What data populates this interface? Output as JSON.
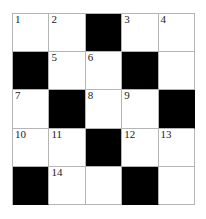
{
  "puzzle": {
    "type": "crossword-grid",
    "rows": 5,
    "cols": 5,
    "colors": {
      "block": "#000000",
      "open": "#ffffff",
      "grid_line": "#b5b5b5",
      "number_text": "#1a1a1a",
      "page_background": "#ffffff"
    },
    "cells": [
      {
        "row": 1,
        "col": 1,
        "state": "open",
        "number": "1"
      },
      {
        "row": 1,
        "col": 2,
        "state": "open",
        "number": "2"
      },
      {
        "row": 1,
        "col": 3,
        "state": "block",
        "number": ""
      },
      {
        "row": 1,
        "col": 4,
        "state": "open",
        "number": "3"
      },
      {
        "row": 1,
        "col": 5,
        "state": "open",
        "number": "4"
      },
      {
        "row": 2,
        "col": 1,
        "state": "block",
        "number": ""
      },
      {
        "row": 2,
        "col": 2,
        "state": "open",
        "number": "5"
      },
      {
        "row": 2,
        "col": 3,
        "state": "open",
        "number": "6"
      },
      {
        "row": 2,
        "col": 4,
        "state": "block",
        "number": ""
      },
      {
        "row": 2,
        "col": 5,
        "state": "open",
        "number": ""
      },
      {
        "row": 3,
        "col": 1,
        "state": "open",
        "number": "7"
      },
      {
        "row": 3,
        "col": 2,
        "state": "block",
        "number": ""
      },
      {
        "row": 3,
        "col": 3,
        "state": "open",
        "number": "8"
      },
      {
        "row": 3,
        "col": 4,
        "state": "open",
        "number": "9"
      },
      {
        "row": 3,
        "col": 5,
        "state": "block",
        "number": ""
      },
      {
        "row": 4,
        "col": 1,
        "state": "open",
        "number": "10"
      },
      {
        "row": 4,
        "col": 2,
        "state": "open",
        "number": "11"
      },
      {
        "row": 4,
        "col": 3,
        "state": "block",
        "number": ""
      },
      {
        "row": 4,
        "col": 4,
        "state": "open",
        "number": "12"
      },
      {
        "row": 4,
        "col": 5,
        "state": "open",
        "number": "13"
      },
      {
        "row": 5,
        "col": 1,
        "state": "block",
        "number": ""
      },
      {
        "row": 5,
        "col": 2,
        "state": "open",
        "number": "14"
      },
      {
        "row": 5,
        "col": 3,
        "state": "open",
        "number": ""
      },
      {
        "row": 5,
        "col": 4,
        "state": "block",
        "number": ""
      },
      {
        "row": 5,
        "col": 5,
        "state": "open",
        "number": ""
      }
    ]
  }
}
